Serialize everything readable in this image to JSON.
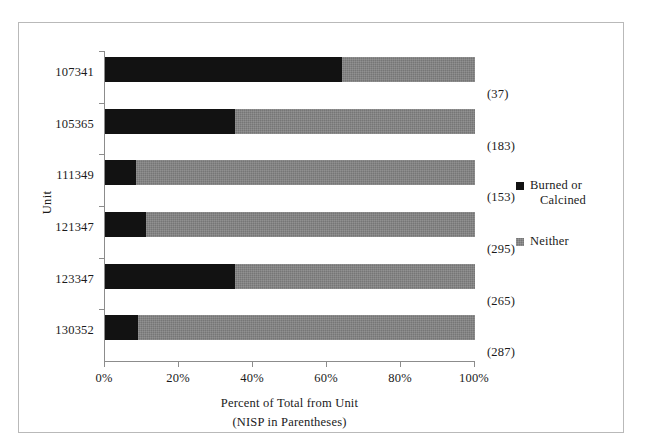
{
  "chart_data": {
    "type": "bar",
    "subtype": "horizontal-stacked-100-percent",
    "title": "",
    "xlabel": "Percent of Total from Unit",
    "xlabel_line2": "(NISP in Parentheses)",
    "ylabel": "Unit",
    "xlim": [
      0,
      100
    ],
    "grid": false,
    "legend_position": "right",
    "x_tick_labels": [
      "0%",
      "20%",
      "40%",
      "60%",
      "80%",
      "100%"
    ],
    "x_tick_values": [
      0,
      20,
      40,
      60,
      80,
      100
    ],
    "categories": [
      "107341",
      "105365",
      "111349",
      "121347",
      "123347",
      "130352"
    ],
    "point_labels": [
      "(37)",
      "(183)",
      "(153)",
      "(295)",
      "(265)",
      "(287)"
    ],
    "point_label_values": [
      37,
      183,
      153,
      295,
      265,
      287
    ],
    "series": [
      {
        "name": "Burned or Calcined",
        "color": "#121212",
        "values": [
          64,
          35,
          8.5,
          11,
          35,
          9
        ]
      },
      {
        "name": "Neither",
        "color": "#767676",
        "values": [
          36,
          65,
          91.5,
          89,
          65,
          91
        ]
      }
    ]
  },
  "legend": {
    "entries": [
      {
        "label_line1": "Burned or",
        "label_line2": "Calcined",
        "swatch": "black-square-swatch"
      },
      {
        "label_line1": "Neither",
        "label_line2": "",
        "swatch": "gray-square-swatch"
      }
    ]
  },
  "colors": {
    "burned": "#121212",
    "neither": "#767676",
    "axis": "#8c8c8c",
    "frame": "#b9b9b9",
    "text": "#1a1a1a",
    "background": "#ffffff"
  }
}
